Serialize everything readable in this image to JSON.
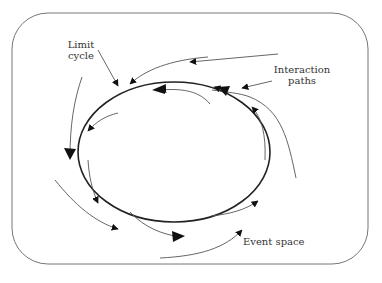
{
  "diagram": {
    "labels": {
      "limit_cycle_line1": "Limit",
      "limit_cycle_line2": "cycle",
      "interaction_line1": "Interaction",
      "interaction_line2": "paths",
      "event_space": "Event space"
    },
    "elements": {
      "boundary": "event-space-boundary",
      "cycle": "limit-cycle-ellipse",
      "paths_count": 14
    },
    "colors": {
      "stroke": "#222222",
      "thin_stroke": "#555555",
      "border": "#777777",
      "background": "#ffffff"
    }
  }
}
